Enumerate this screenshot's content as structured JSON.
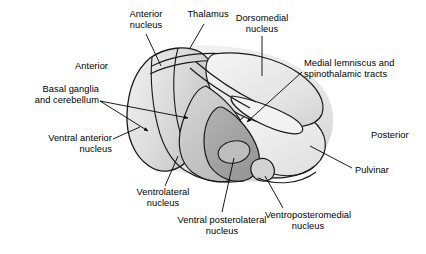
{
  "figure": {
    "type": "anatomical-illustration",
    "subject": "thalamus"
  },
  "labels": {
    "anterior_nucleus": "Anterior\nnucleus",
    "thalamus": "Thalamus",
    "dorsomedial_nucleus": "Dorsomedial\nnucleus",
    "medial_lemniscus": "Medial lemniscus and\nspinothalamic tracts",
    "anterior": "Anterior",
    "basal_ganglia": "Basal ganglia\nand cerebellum",
    "ventral_anterior_nucleus": "Ventral anterior\nnucleus",
    "ventrolateral_nucleus": "Ventrolateral\nnucleus",
    "ventral_posterolateral_nucleus": "Ventral posterolateral\nnucleus",
    "ventroposteromedial_nucleus": "Ventroposteromedial\nnucleus",
    "posterior": "Posterior",
    "pulvinar": "Pulvinar"
  },
  "colors": {
    "outline": "#1a1a1a",
    "background": "#ffffff",
    "text": "#000000",
    "fill_light": "#e8e8e8",
    "fill_mid": "#cfcfcf",
    "fill_dark": "#a8a8a8",
    "fill_darker": "#909090",
    "fill_pulvinar": "#ececec"
  }
}
